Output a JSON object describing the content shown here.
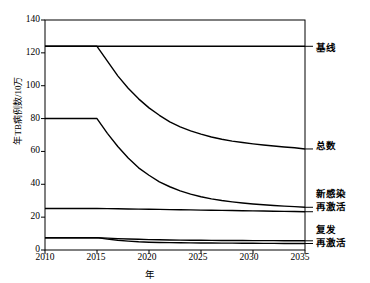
{
  "chart_data": {
    "type": "line",
    "title": "",
    "xlabel": "年",
    "ylabel": "年TB病例数/10万",
    "xlim": [
      2010,
      2035
    ],
    "ylim": [
      0,
      140
    ],
    "grid": false,
    "legend_position": "right-of-plot-at-line-ends",
    "xticks": [
      "2010",
      "2015",
      "2020",
      "2025",
      "2030",
      "2035"
    ],
    "yticks": [
      "0",
      "20",
      "40",
      "60",
      "80",
      "100",
      "120",
      "140"
    ],
    "x": [
      2010,
      2011,
      2012,
      2013,
      2014,
      2015,
      2016,
      2017,
      2018,
      2019,
      2020,
      2021,
      2022,
      2023,
      2024,
      2025,
      2026,
      2027,
      2028,
      2029,
      2030,
      2031,
      2032,
      2033,
      2034,
      2035
    ],
    "series": [
      {
        "name": "基线",
        "label": "基线",
        "values": [
          124,
          124,
          124,
          124,
          124,
          124,
          124,
          124,
          124,
          124,
          124,
          124,
          124,
          124,
          124,
          124,
          124,
          124,
          124,
          124,
          124,
          124,
          124,
          124,
          124,
          124
        ]
      },
      {
        "name": "总数",
        "label": "总数",
        "values": [
          124,
          124,
          124,
          124,
          124,
          124,
          115,
          106,
          98.5,
          92,
          86.5,
          82,
          78,
          75,
          72.5,
          70.5,
          68.8,
          67.4,
          66.3,
          65.4,
          64.6,
          63.9,
          63.3,
          62.7,
          62.2,
          61.5
        ]
      },
      {
        "name": "新感染",
        "label": "新感染",
        "values": [
          80,
          80,
          80,
          80,
          80,
          80,
          71,
          63,
          56,
          50,
          45.5,
          41.5,
          38.5,
          36,
          34,
          32.4,
          31.1,
          30.1,
          29.3,
          28.6,
          28.0,
          27.5,
          27.1,
          26.7,
          26.4,
          26.0
        ]
      },
      {
        "name": "再激活",
        "label": "再激活",
        "values": [
          25.3,
          25.3,
          25.3,
          25.3,
          25.3,
          25.3,
          25.2,
          25.1,
          25.0,
          24.9,
          24.8,
          24.7,
          24.6,
          24.5,
          24.4,
          24.3,
          24.2,
          24.1,
          24.0,
          23.9,
          23.8,
          23.7,
          23.6,
          23.5,
          23.4,
          23.3
        ]
      },
      {
        "name": "复发",
        "label": "复发",
        "values": [
          7.5,
          7.5,
          7.5,
          7.5,
          7.5,
          7.5,
          7.2,
          6.9,
          6.7,
          6.5,
          6.3,
          6.2,
          6.1,
          6.0,
          5.95,
          5.9,
          5.85,
          5.8,
          5.78,
          5.75,
          5.72,
          5.7,
          5.68,
          5.66,
          5.64,
          5.6
        ]
      },
      {
        "name": "再激活2",
        "label": "再激活",
        "values": [
          7.5,
          7.5,
          7.5,
          7.5,
          7.5,
          7.5,
          6.6,
          5.9,
          5.4,
          5.0,
          4.75,
          4.6,
          4.5,
          4.42,
          4.36,
          4.3,
          4.25,
          4.2,
          4.16,
          4.12,
          4.09,
          4.06,
          4.03,
          4.0,
          3.98,
          3.95
        ]
      }
    ]
  },
  "series_labels": {
    "baseline": "基线",
    "total": "总数",
    "new_infection": "新感染",
    "reactivation": "再激活",
    "relapse": "复发",
    "reactivation2": "再激活"
  },
  "axis": {
    "y_title": "年TB病例数/10万",
    "x_title": "年",
    "y_0": "0",
    "y_20": "20",
    "y_40": "40",
    "y_60": "60",
    "y_80": "80",
    "y_100": "100",
    "y_120": "120",
    "y_140": "140",
    "x_2010": "2010",
    "x_2015": "2015",
    "x_2020": "2020",
    "x_2025": "2025",
    "x_2030": "2030",
    "x_2035": "2035"
  },
  "colors": {
    "line": "#000000",
    "background": "#ffffff",
    "axis": "#000000"
  }
}
